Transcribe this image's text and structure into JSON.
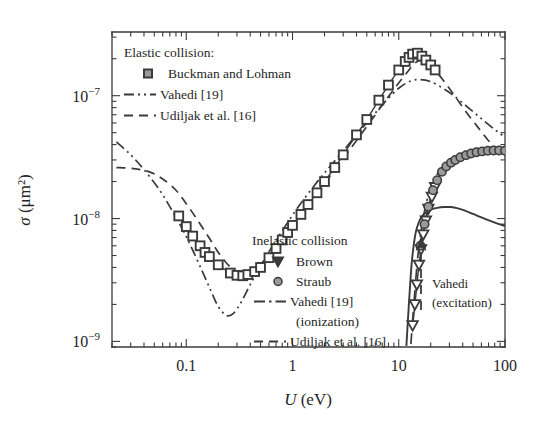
{
  "figure": {
    "background_color": "#ffffff",
    "ink_color": "#3a3a3a",
    "marker_fill": "#9a9a9a"
  },
  "axes": {
    "x": {
      "label_symbol": "U",
      "label_unit": "(eV)",
      "scale": "log",
      "range": [
        0.02,
        100
      ],
      "tick_labels": [
        "0.1",
        "1",
        "10",
        "100"
      ],
      "tick_values": [
        0.1,
        1,
        10,
        100
      ]
    },
    "y": {
      "label_symbol": "σ",
      "label_unit": "(μm²)",
      "scale": "log",
      "range": [
        9e-10,
        3.3e-07
      ],
      "tick_labels": [
        "10⁻⁹",
        "10⁻⁸",
        "10⁻⁷"
      ],
      "tick_mantissa": [
        "10",
        "10",
        "10"
      ],
      "tick_exponents": [
        "−9",
        "−8",
        "−7"
      ],
      "tick_values": [
        1e-09,
        1e-08,
        1e-07
      ]
    }
  },
  "legend_elastic": {
    "title": "Elastic collision:",
    "entries": [
      {
        "label": "Buckman and Lohman",
        "marker": "square-marker",
        "style": "marker"
      },
      {
        "label": "Vahedi [19]",
        "marker": "dash-dot-dot-line",
        "style": "dashdotdot"
      },
      {
        "label": "Udiljak et al. [16]",
        "marker": "dashed-line",
        "style": "dashed"
      }
    ]
  },
  "legend_inelastic": {
    "title": "Inelastic collision",
    "entries": [
      {
        "label": "Brown",
        "marker": "triangle-down-marker",
        "style": "marker"
      },
      {
        "label": "Straub",
        "marker": "circle-marker",
        "style": "marker"
      },
      {
        "label": "Vahedi [19]",
        "label2": "(ionization)",
        "marker": "dash-dot-line",
        "style": "dashdot"
      },
      {
        "label": "Udiljak et al. [16]",
        "marker": "dashed-line",
        "style": "dashed"
      }
    ]
  },
  "annotation": {
    "line1": "Vahedi",
    "line2": "(excitation)",
    "arrow": "up-arrow-icon"
  },
  "chart_data": {
    "type": "scatter",
    "title": "",
    "xlabel": "U (eV)",
    "ylabel": "σ (μm²)",
    "xscale": "log",
    "yscale": "log",
    "xlim": [
      0.02,
      100
    ],
    "ylim": [
      9e-10,
      3.3e-07
    ],
    "grid": false,
    "legend_position": "upper-left and center-right",
    "series": [
      {
        "name": "Buckman and Lohman",
        "type": "scatter",
        "marker": "square",
        "group": "elastic",
        "points": [
          [
            0.085,
            1.05e-08
          ],
          [
            0.1,
            8.6e-09
          ],
          [
            0.115,
            7.2e-09
          ],
          [
            0.135,
            6e-09
          ],
          [
            0.15,
            5.3e-09
          ],
          [
            0.165,
            4.9e-09
          ],
          [
            0.2,
            4.2e-09
          ],
          [
            0.26,
            3.6e-09
          ],
          [
            0.3,
            3.45e-09
          ],
          [
            0.34,
            3.42e-09
          ],
          [
            0.38,
            3.5e-09
          ],
          [
            0.44,
            3.7e-09
          ],
          [
            0.5,
            4e-09
          ],
          [
            0.6,
            4.8e-09
          ],
          [
            0.7,
            5.7e-09
          ],
          [
            0.8,
            6.7e-09
          ],
          [
            0.9,
            7.7e-09
          ],
          [
            1.0,
            8.8e-09
          ],
          [
            1.2,
            1.08e-08
          ],
          [
            1.4,
            1.3e-08
          ],
          [
            1.7,
            1.62e-08
          ],
          [
            2.0,
            2e-08
          ],
          [
            2.5,
            2.6e-08
          ],
          [
            3.0,
            3.3e-08
          ],
          [
            4.0,
            4.8e-08
          ],
          [
            5.0,
            6.4e-08
          ],
          [
            6.5,
            9.2e-08
          ],
          [
            8.0,
            1.22e-07
          ],
          [
            10.0,
            1.62e-07
          ],
          [
            11.5,
            1.9e-07
          ],
          [
            12.5,
            2.05e-07
          ],
          [
            13.5,
            2.18e-07
          ],
          [
            15.0,
            2.22e-07
          ],
          [
            16.5,
            2.1e-07
          ],
          [
            18.0,
            1.95e-07
          ],
          [
            20.0,
            1.78e-07
          ],
          [
            22.0,
            1.62e-07
          ]
        ]
      },
      {
        "name": "Vahedi [19]",
        "type": "line",
        "linestyle": "dashdotdot",
        "group": "elastic",
        "points": [
          [
            0.022,
            4.2e-08
          ],
          [
            0.03,
            3.3e-08
          ],
          [
            0.04,
            2.5e-08
          ],
          [
            0.055,
            1.75e-08
          ],
          [
            0.07,
            1.25e-08
          ],
          [
            0.09,
            8.5e-09
          ],
          [
            0.11,
            6e-09
          ],
          [
            0.14,
            3.8e-09
          ],
          [
            0.17,
            2.6e-09
          ],
          [
            0.2,
            1.92e-09
          ],
          [
            0.24,
            1.62e-09
          ],
          [
            0.28,
            1.7e-09
          ],
          [
            0.33,
            2.1e-09
          ],
          [
            0.4,
            2.9e-09
          ],
          [
            0.5,
            4.1e-09
          ],
          [
            0.65,
            6e-09
          ],
          [
            0.85,
            8.6e-09
          ],
          [
            1.1,
            1.2e-08
          ],
          [
            1.5,
            1.72e-08
          ],
          [
            2.0,
            2.35e-08
          ],
          [
            2.8,
            3.3e-08
          ],
          [
            4.0,
            4.8e-08
          ],
          [
            5.5,
            6.6e-08
          ],
          [
            7.5,
            9e-08
          ],
          [
            10.0,
            1.15e-07
          ],
          [
            13.0,
            1.32e-07
          ],
          [
            16.0,
            1.35e-07
          ],
          [
            20.0,
            1.3e-07
          ],
          [
            26.0,
            1.15e-07
          ],
          [
            33.0,
            1e-07
          ],
          [
            45.0,
            8e-08
          ],
          [
            60.0,
            6.5e-08
          ],
          [
            80.0,
            5.3e-08
          ],
          [
            100.0,
            4.6e-08
          ]
        ]
      },
      {
        "name": "Udiljak et al. [16]",
        "type": "line",
        "linestyle": "dashed",
        "group": "elastic",
        "points": [
          [
            0.022,
            2.6e-08
          ],
          [
            0.032,
            2.55e-08
          ],
          [
            0.045,
            2.4e-08
          ],
          [
            0.06,
            2.1e-08
          ],
          [
            0.08,
            1.7e-08
          ],
          [
            0.1,
            1.32e-08
          ],
          [
            0.13,
            9.5e-09
          ],
          [
            0.165,
            6.9e-09
          ],
          [
            0.21,
            5e-09
          ],
          [
            0.27,
            3.9e-09
          ],
          [
            0.34,
            3.5e-09
          ],
          [
            0.43,
            3.8e-09
          ],
          [
            0.55,
            4.6e-09
          ],
          [
            0.72,
            6e-09
          ],
          [
            0.95,
            8.2e-09
          ],
          [
            1.3,
            1.18e-08
          ],
          [
            1.8,
            1.7e-08
          ],
          [
            2.5,
            2.5e-08
          ],
          [
            3.5,
            3.7e-08
          ],
          [
            5.0,
            5.6e-08
          ],
          [
            7.0,
            8.4e-08
          ],
          [
            9.5,
            1.2e-07
          ],
          [
            12.0,
            1.55e-07
          ],
          [
            14.0,
            1.82e-07
          ],
          [
            16.0,
            1.95e-07
          ],
          [
            18.0,
            1.88e-07
          ],
          [
            21.0,
            1.68e-07
          ],
          [
            26.0,
            1.35e-07
          ],
          [
            33.0,
            1.02e-07
          ],
          [
            42.0,
            7.6e-08
          ],
          [
            55.0,
            5.6e-08
          ],
          [
            70.0,
            4.3e-08
          ],
          [
            85.0,
            3.6e-08
          ],
          [
            100.0,
            3.2e-08
          ]
        ]
      },
      {
        "name": "Brown",
        "type": "scatter",
        "marker": "triangle-down",
        "group": "inelastic",
        "points": [
          [
            13.5,
            1.35e-09
          ],
          [
            14.2,
            2e-09
          ],
          [
            14.8,
            2.9e-09
          ],
          [
            15.5,
            4.2e-09
          ],
          [
            16.2,
            5.6e-09
          ],
          [
            17.0,
            7.4e-09
          ],
          [
            18.0,
            9.6e-09
          ],
          [
            19.0,
            1.2e-08
          ],
          [
            20.5,
            1.5e-08
          ],
          [
            22.0,
            1.8e-08
          ]
        ]
      },
      {
        "name": "Straub",
        "type": "scatter",
        "marker": "circle",
        "group": "inelastic",
        "points": [
          [
            16.0,
            6e-09
          ],
          [
            17.5,
            9e-09
          ],
          [
            19.0,
            1.25e-08
          ],
          [
            21.0,
            1.7e-08
          ],
          [
            23.0,
            2.05e-08
          ],
          [
            25.5,
            2.4e-08
          ],
          [
            28.0,
            2.65e-08
          ],
          [
            31.0,
            2.85e-08
          ],
          [
            34.0,
            3e-08
          ],
          [
            38.0,
            3.15e-08
          ],
          [
            43.0,
            3.28e-08
          ],
          [
            48.0,
            3.38e-08
          ],
          [
            54.0,
            3.46e-08
          ],
          [
            61.0,
            3.52e-08
          ],
          [
            69.0,
            3.56e-08
          ],
          [
            78.0,
            3.58e-08
          ],
          [
            88.0,
            3.58e-08
          ],
          [
            100.0,
            3.56e-08
          ]
        ]
      },
      {
        "name": "Vahedi [19] (ionization)",
        "type": "line",
        "linestyle": "dashdot",
        "group": "inelastic",
        "points": [
          [
            13.0,
            9.5e-10
          ],
          [
            13.6,
            1.6e-09
          ],
          [
            14.3,
            2.8e-09
          ],
          [
            15.0,
            4.6e-09
          ],
          [
            16.0,
            7.2e-09
          ],
          [
            17.0,
            1.02e-08
          ],
          [
            18.5,
            1.42e-08
          ],
          [
            20.0,
            1.78e-08
          ],
          [
            22.0,
            2.15e-08
          ],
          [
            24.5,
            2.48e-08
          ],
          [
            27.0,
            2.72e-08
          ],
          [
            30.0,
            2.95e-08
          ],
          [
            34.0,
            3.15e-08
          ],
          [
            39.0,
            3.32e-08
          ],
          [
            45.0,
            3.45e-08
          ],
          [
            52.0,
            3.55e-08
          ],
          [
            60.0,
            3.62e-08
          ],
          [
            70.0,
            3.66e-08
          ],
          [
            82.0,
            3.68e-08
          ],
          [
            100.0,
            3.68e-08
          ]
        ]
      },
      {
        "name": "Vahedi (excitation)",
        "type": "line",
        "linestyle": "solid",
        "group": "inelastic",
        "points": [
          [
            11.8,
            9.2e-10
          ],
          [
            12.2,
            1.5e-09
          ],
          [
            12.7,
            2.6e-09
          ],
          [
            13.2,
            4.2e-09
          ],
          [
            13.8,
            6e-09
          ],
          [
            14.5,
            7.8e-09
          ],
          [
            15.5,
            9.4e-09
          ],
          [
            16.5,
            1.04e-08
          ],
          [
            18.0,
            1.12e-08
          ],
          [
            20.0,
            1.18e-08
          ],
          [
            23.0,
            1.22e-08
          ],
          [
            27.0,
            1.24e-08
          ],
          [
            31.0,
            1.24e-08
          ],
          [
            36.0,
            1.21e-08
          ],
          [
            42.0,
            1.16e-08
          ],
          [
            50.0,
            1.09e-08
          ],
          [
            60.0,
            1.02e-08
          ],
          [
            72.0,
            9.6e-09
          ],
          [
            85.0,
            9.1e-09
          ],
          [
            100.0,
            8.7e-09
          ]
        ]
      }
    ]
  }
}
